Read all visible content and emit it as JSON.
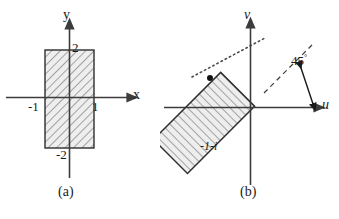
{
  "figure": {
    "kind": "math-diagram",
    "stroke_color": "#3c3c3c",
    "hatch_color": "#8a8a8a",
    "fill_color": "#e8e8e8",
    "text_color": "#1a1a1a"
  },
  "panel_a": {
    "caption": "(a)",
    "axis_x_label": "x",
    "axis_y_label": "y",
    "tick_top": "2",
    "tick_bottom": "-2",
    "tick_left": "-1",
    "tick_right": "1",
    "region": {
      "x_min": -1,
      "x_max": 1,
      "y_min": -2,
      "y_max": 2,
      "hatched": true
    }
  },
  "panel_b": {
    "caption": "(b)",
    "axis_u_label": "u",
    "axis_v_label": "v",
    "angle_label": "45",
    "angle_degree_symbol": "°",
    "point_label": "-1-i",
    "rotation_degrees": 45,
    "region": {
      "rotated": true,
      "hatched": true
    }
  }
}
